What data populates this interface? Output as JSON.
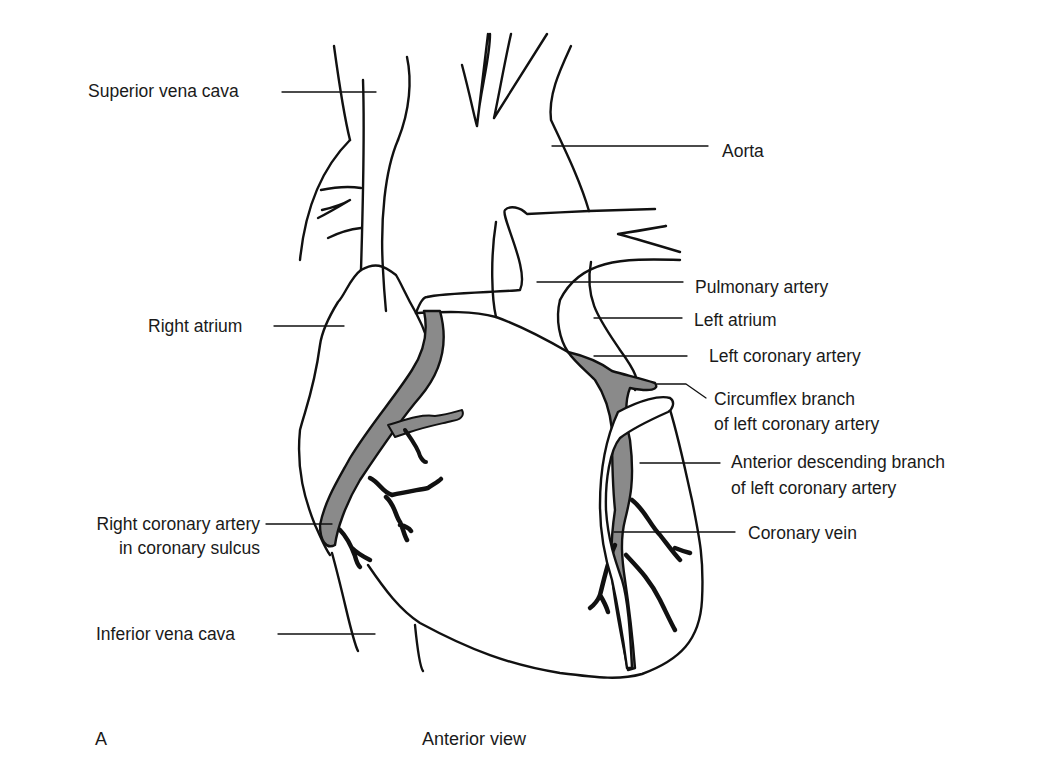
{
  "diagram": {
    "title": "Anterior view",
    "panel_letter": "A",
    "colors": {
      "outline": "#111111",
      "artery_fill": "#8a8a8a",
      "vein_fill": "#ffffff",
      "background": "#ffffff",
      "text": "#1a1a1a"
    },
    "labels_left": [
      {
        "id": "superior-vena-cava",
        "text": "Superior vena cava"
      },
      {
        "id": "right-atrium",
        "text": "Right atrium"
      },
      {
        "id": "right-coronary-artery",
        "line1": "Right coronary artery",
        "line2": "in coronary sulcus"
      },
      {
        "id": "inferior-vena-cava",
        "text": "Inferior vena cava"
      }
    ],
    "labels_right": [
      {
        "id": "aorta",
        "text": "Aorta"
      },
      {
        "id": "pulmonary-artery",
        "text": "Pulmonary artery"
      },
      {
        "id": "left-atrium",
        "text": "Left atrium"
      },
      {
        "id": "left-coronary-artery",
        "text": "Left coronary artery"
      },
      {
        "id": "circumflex-branch",
        "line1": "Circumflex branch",
        "line2": "of left coronary artery"
      },
      {
        "id": "anterior-descending-branch",
        "line1": "Anterior descending branch",
        "line2": "of left coronary artery"
      },
      {
        "id": "coronary-vein",
        "text": "Coronary vein"
      }
    ]
  }
}
